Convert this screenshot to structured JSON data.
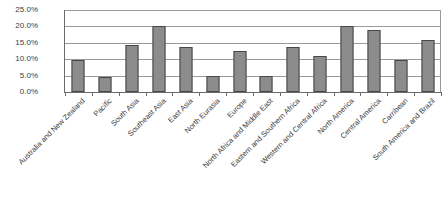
{
  "chart_data": {
    "type": "bar",
    "title": "",
    "xlabel": "",
    "ylabel": "",
    "ylim": [
      0,
      25
    ],
    "grid": true,
    "legend": "none",
    "y_ticks": [
      "0.0%",
      "5.0%",
      "10.0%",
      "15.0%",
      "20.0%",
      "25.0%"
    ],
    "y_tick_values": [
      0,
      5,
      10,
      15,
      20,
      25
    ],
    "categories": [
      "Australia and New Zealand",
      "Pacific",
      "South Asia",
      "Southeast Asia",
      "East Asia",
      "North Eurasia",
      "Europe",
      "North Africa and Middle East",
      "Eastern and Southern Africa",
      "Western and Central Africa",
      "North America",
      "Central America",
      "Carribean",
      "South America and Brazil"
    ],
    "values": [
      9.8,
      4.6,
      14.2,
      20.0,
      13.6,
      4.9,
      12.6,
      4.9,
      13.6,
      10.9,
      20.1,
      18.9,
      9.8,
      16.0
    ],
    "value_labels": [
      "9.8%",
      "4.6%",
      "14.2%",
      "20.0%",
      "13.6%",
      "4.9%",
      "12.6%",
      "4.9%",
      "13.6%",
      "10.9%",
      "20.1%",
      "18.9%",
      "9.8%",
      "16.0%"
    ],
    "bar_color": "#8c8c8c",
    "bar_border_color": "#474747",
    "gridline_color": "#9a9a9a",
    "axis_color": "#6b6b6b",
    "background_color": "#ffffff"
  }
}
